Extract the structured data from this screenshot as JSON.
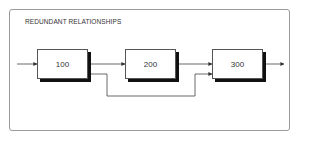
{
  "diagram": {
    "title": "REDUNDANT RELATIONSHIPS",
    "nodes": [
      {
        "id": "100",
        "label": "100"
      },
      {
        "id": "200",
        "label": "200"
      },
      {
        "id": "300",
        "label": "300"
      }
    ],
    "edges": [
      {
        "from": "input",
        "to": "100"
      },
      {
        "from": "100",
        "to": "200"
      },
      {
        "from": "200",
        "to": "300"
      },
      {
        "from": "100",
        "to": "300",
        "type": "bypass"
      },
      {
        "from": "300",
        "to": "output"
      }
    ],
    "colors": {
      "line": "#333333",
      "shadow": "#111111",
      "frame": "#9a9a9a"
    }
  }
}
